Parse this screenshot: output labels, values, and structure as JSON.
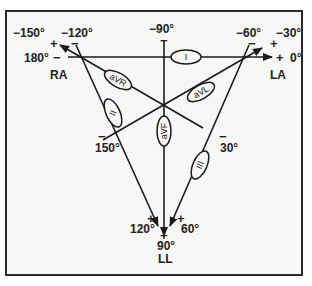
{
  "diagram": {
    "vertices": {
      "ra": "RA",
      "la": "LA",
      "ll": "LL"
    },
    "leads": {
      "i": "I",
      "ii": "II",
      "iii": "III",
      "avr": "aVR",
      "avl": "aVL",
      "avf": "aVF"
    },
    "angles": {
      "neg150": "−150°",
      "neg120": "−120°",
      "deg180": "180°",
      "neg90": "−90°",
      "neg60": "−60°",
      "neg30": "−30°",
      "deg0": "0°",
      "deg150": "150°",
      "deg30": "30°",
      "deg120": "120°",
      "deg90": "90°",
      "deg60": "60°"
    },
    "signs": {
      "plus": "+",
      "minus": "−"
    },
    "colors": {
      "line": "#1a1a1a",
      "background": "#f7f7f5",
      "frame": "#2a2a2a"
    }
  }
}
